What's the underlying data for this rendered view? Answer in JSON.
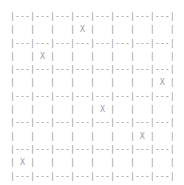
{
  "grid": {
    "columns": 8,
    "rows": 6,
    "marker": "X",
    "separator_line": "|---|---|---|---|---|---|---|---|",
    "cells": [
      [
        "",
        "",
        "",
        "X",
        "",
        "",
        "",
        ""
      ],
      [
        "",
        "X",
        "",
        "",
        "",
        "",
        "",
        ""
      ],
      [
        "",
        "",
        "",
        "",
        "",
        "",
        "",
        "X"
      ],
      [
        "",
        "",
        "",
        "",
        "X",
        "",
        "",
        ""
      ],
      [
        "",
        "",
        "",
        "",
        "",
        "",
        "X",
        ""
      ],
      [
        "X",
        "",
        "",
        "",
        "",
        "",
        "",
        ""
      ]
    ],
    "text_color": "#9a9a9a"
  }
}
